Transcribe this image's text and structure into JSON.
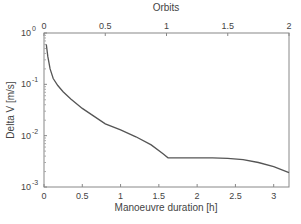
{
  "chart_data": {
    "type": "line",
    "title": "",
    "xlabel": "Manoeuvre duration [h]",
    "ylabel": "Delta V [m/s]",
    "x2label": "Orbits",
    "yscale": "log",
    "xlim": [
      0,
      3.2
    ],
    "ylim": [
      0.001,
      1
    ],
    "x2lim": [
      0,
      2
    ],
    "xticks": [
      "0",
      "0.5",
      "1",
      "1.5",
      "2",
      "2.5",
      "3"
    ],
    "x2ticks": [
      "0",
      "0.5",
      "1",
      "1.5",
      "2"
    ],
    "yticks": [
      "10^0",
      "10^-1",
      "10^-2",
      "10^-3"
    ],
    "grid": false,
    "series": [
      {
        "name": "Delta V",
        "color": "#555555",
        "x": [
          0.03,
          0.05,
          0.08,
          0.12,
          0.18,
          0.25,
          0.35,
          0.5,
          0.65,
          0.8,
          1.0,
          1.2,
          1.4,
          1.55,
          1.62,
          1.8,
          2.0,
          2.2,
          2.4,
          2.6,
          2.8,
          3.0,
          3.2
        ],
        "values": [
          0.6,
          0.35,
          0.2,
          0.13,
          0.095,
          0.072,
          0.052,
          0.034,
          0.024,
          0.017,
          0.013,
          0.0095,
          0.0066,
          0.0045,
          0.0037,
          0.0037,
          0.0037,
          0.0037,
          0.0036,
          0.0034,
          0.003,
          0.0025,
          0.0019
        ]
      }
    ]
  }
}
